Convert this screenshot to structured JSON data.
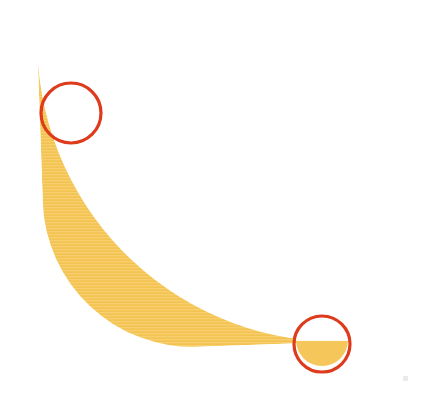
{
  "figure": {
    "subject_name": "honeycomb-arc",
    "background_color": "#ffffff",
    "width": 423,
    "height": 400
  },
  "arc": {
    "name": "honeycomb-band",
    "fill_color": "#f5c75a",
    "fill_color_light": "#f8d174",
    "fill_color_dark": "#efbe49",
    "texture": "horizontal-scanlines",
    "center_x": 48,
    "center_y": 352,
    "inner_radius": 150,
    "outer_radius": 300,
    "start_angle_deg": -92,
    "end_angle_deg": -2,
    "description": "Quarter-annulus band sweeping from upper-left to lower-right"
  },
  "perforations": {
    "name": "hexagonal-cells",
    "shape": "hexagon",
    "hole_color": "#ffffff",
    "count": 86,
    "size_range_px": [
      4,
      26
    ],
    "gradient_note": "Cell size increases from inner edge toward outer edge",
    "cells": [
      {
        "cx": 118,
        "cy": 48,
        "r": 14,
        "rot": 0
      },
      {
        "cx": 152,
        "cy": 42,
        "r": 12,
        "rot": 10
      },
      {
        "cx": 180,
        "cy": 56,
        "r": 13,
        "rot": 0
      },
      {
        "cx": 141,
        "cy": 76,
        "r": 11,
        "rot": 15
      },
      {
        "cx": 172,
        "cy": 88,
        "r": 14,
        "rot": 0
      },
      {
        "cx": 205,
        "cy": 72,
        "r": 12,
        "rot": 8
      },
      {
        "cx": 112,
        "cy": 86,
        "r": 8,
        "rot": 0
      },
      {
        "cx": 207,
        "cy": 100,
        "r": 11,
        "rot": 0
      },
      {
        "cx": 236,
        "cy": 88,
        "r": 13,
        "rot": 12
      },
      {
        "cx": 148,
        "cy": 108,
        "r": 8,
        "rot": 0
      },
      {
        "cx": 176,
        "cy": 118,
        "r": 9,
        "rot": 0
      },
      {
        "cx": 118,
        "cy": 116,
        "r": 6,
        "rot": 0
      },
      {
        "cx": 205,
        "cy": 126,
        "r": 8,
        "rot": 0
      },
      {
        "cx": 234,
        "cy": 116,
        "r": 10,
        "rot": 0
      },
      {
        "cx": 262,
        "cy": 104,
        "r": 13,
        "rot": 5
      },
      {
        "cx": 289,
        "cy": 118,
        "r": 12,
        "rot": 0
      },
      {
        "cx": 259,
        "cy": 132,
        "r": 9,
        "rot": 0
      },
      {
        "cx": 232,
        "cy": 142,
        "r": 7,
        "rot": 0
      },
      {
        "cx": 204,
        "cy": 150,
        "r": 6,
        "rot": 0
      },
      {
        "cx": 176,
        "cy": 144,
        "r": 5,
        "rot": 0
      },
      {
        "cx": 285,
        "cy": 146,
        "r": 11,
        "rot": 0
      },
      {
        "cx": 312,
        "cy": 134,
        "r": 13,
        "rot": 8
      },
      {
        "cx": 310,
        "cy": 162,
        "r": 12,
        "rot": 0
      },
      {
        "cx": 283,
        "cy": 172,
        "r": 9,
        "rot": 0
      },
      {
        "cx": 257,
        "cy": 160,
        "r": 7,
        "rot": 0
      },
      {
        "cx": 231,
        "cy": 170,
        "r": 5,
        "rot": 0
      },
      {
        "cx": 334,
        "cy": 154,
        "r": 11,
        "rot": 0
      },
      {
        "cx": 337,
        "cy": 182,
        "r": 13,
        "rot": 6
      },
      {
        "cx": 311,
        "cy": 192,
        "r": 10,
        "rot": 0
      },
      {
        "cx": 284,
        "cy": 200,
        "r": 7,
        "rot": 0
      },
      {
        "cx": 258,
        "cy": 192,
        "r": 5,
        "rot": 0
      },
      {
        "cx": 357,
        "cy": 172,
        "r": 10,
        "rot": 0
      },
      {
        "cx": 360,
        "cy": 202,
        "r": 13,
        "rot": 0
      },
      {
        "cx": 336,
        "cy": 212,
        "r": 11,
        "rot": 0
      },
      {
        "cx": 309,
        "cy": 220,
        "r": 8,
        "rot": 0
      },
      {
        "cx": 283,
        "cy": 228,
        "r": 6,
        "rot": 0
      },
      {
        "cx": 376,
        "cy": 192,
        "r": 9,
        "rot": 0
      },
      {
        "cx": 378,
        "cy": 224,
        "r": 12,
        "rot": 0
      },
      {
        "cx": 356,
        "cy": 236,
        "r": 12,
        "rot": 0
      },
      {
        "cx": 331,
        "cy": 244,
        "r": 9,
        "rot": 0
      },
      {
        "cx": 306,
        "cy": 250,
        "r": 6,
        "rot": 0
      },
      {
        "cx": 394,
        "cy": 214,
        "r": 9,
        "rot": 0
      },
      {
        "cx": 392,
        "cy": 248,
        "r": 11,
        "rot": 0
      },
      {
        "cx": 371,
        "cy": 262,
        "r": 12,
        "rot": 0
      },
      {
        "cx": 347,
        "cy": 270,
        "r": 9,
        "rot": 0
      },
      {
        "cx": 323,
        "cy": 276,
        "r": 6,
        "rot": 0
      },
      {
        "cx": 399,
        "cy": 274,
        "r": 10,
        "rot": 0
      },
      {
        "cx": 380,
        "cy": 290,
        "r": 12,
        "rot": 0
      },
      {
        "cx": 357,
        "cy": 296,
        "r": 9,
        "rot": 0
      },
      {
        "cx": 334,
        "cy": 302,
        "r": 6,
        "rot": 0
      },
      {
        "cx": 398,
        "cy": 302,
        "r": 9,
        "rot": 0
      },
      {
        "cx": 382,
        "cy": 318,
        "r": 11,
        "rot": 0
      },
      {
        "cx": 360,
        "cy": 322,
        "r": 8,
        "rot": 0
      },
      {
        "cx": 339,
        "cy": 326,
        "r": 6,
        "rot": 0
      },
      {
        "cx": 392,
        "cy": 344,
        "r": 10,
        "rot": 0
      },
      {
        "cx": 368,
        "cy": 348,
        "r": 8,
        "rot": 0
      },
      {
        "cx": 246,
        "cy": 64,
        "r": 7,
        "rot": 0
      },
      {
        "cx": 268,
        "cy": 78,
        "r": 8,
        "rot": 0
      },
      {
        "cx": 296,
        "cy": 92,
        "r": 9,
        "rot": 0
      },
      {
        "cx": 320,
        "cy": 108,
        "r": 8,
        "rot": 0
      },
      {
        "cx": 344,
        "cy": 128,
        "r": 7,
        "rot": 0
      },
      {
        "cx": 365,
        "cy": 148,
        "r": 6,
        "rot": 0
      },
      {
        "cx": 384,
        "cy": 168,
        "r": 6,
        "rot": 0
      },
      {
        "cx": 90,
        "cy": 62,
        "r": 6,
        "rot": 0
      },
      {
        "cx": 196,
        "cy": 46,
        "r": 6,
        "rot": 0
      }
    ]
  },
  "annotations": {
    "name": "defect-markers",
    "stroke_color": "#de3a1c",
    "stroke_width": 3,
    "count": 2,
    "markers": [
      {
        "id": "marker-top-left",
        "label": "top-left-annotation-circle",
        "cx": 71,
        "cy": 113,
        "rx": 30,
        "ry": 30,
        "detail": "white-crescent-sliver",
        "detail_cx": 69,
        "detail_cy": 111
      },
      {
        "id": "marker-bottom",
        "label": "bottom-annotation-circle",
        "cx": 322,
        "cy": 344,
        "rx": 28,
        "ry": 28,
        "detail": "rounded-band-terminus",
        "detail_cx": 322,
        "detail_cy": 350
      }
    ]
  },
  "artifacts": {
    "name": "scan-speck",
    "specks": [
      {
        "x": 403,
        "y": 376,
        "color": "#d9d9d9"
      }
    ]
  }
}
